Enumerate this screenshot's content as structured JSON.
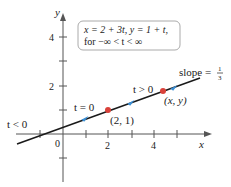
{
  "figure": {
    "equation_box": {
      "line1": "x = 2 + 3t, y = 1 + t,",
      "line2": "for −∞ < t < ∞"
    },
    "axes": {
      "x_label": "x",
      "y_label": "y",
      "origin_label": "0",
      "x_tick_labels": [
        "2",
        "4"
      ],
      "y_tick_labels": [
        "4",
        "2"
      ]
    },
    "annotations": {
      "t_neg": "t < 0",
      "t_zero": "t = 0",
      "t_pos": "t > 0",
      "point_fixed": "(2, 1)",
      "point_general": "(x, y)",
      "slope_text": "slope =",
      "slope_num": "1",
      "slope_den": "3"
    },
    "colors": {
      "line": "#1a1a1a",
      "point": "#d9413a",
      "arrow": "#3a8fd6",
      "box_border": "#aaaaaa"
    }
  }
}
